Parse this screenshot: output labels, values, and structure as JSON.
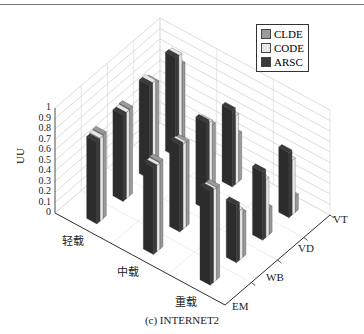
{
  "caption": "(c)  INTERNET2",
  "legend": [
    {
      "label": "CLDE",
      "color": "#9a9a9a"
    },
    {
      "label": "CODE",
      "color": "#e8e8e8"
    },
    {
      "label": "ARSC",
      "color": "#3a3a3a"
    }
  ],
  "yaxis": {
    "label": "UU",
    "ticks": [
      "0",
      "0.1",
      "0.2",
      "0.3",
      "0.4",
      "0.5",
      "0.6",
      "0.7",
      "0.8",
      "0.9",
      "1"
    ]
  },
  "load_labels": [
    "轻载",
    "中载",
    "重载"
  ],
  "method_labels": [
    "EM",
    "WB",
    "VD",
    "VT"
  ],
  "chart_data": {
    "type": "bar3d",
    "title": "(c) INTERNET2",
    "xlabel": "",
    "ylabel": "UU",
    "zlim": [
      0,
      1
    ],
    "load_categories": [
      "轻载",
      "中载",
      "重载"
    ],
    "method_categories": [
      "EM",
      "WB",
      "VD",
      "VT"
    ],
    "series": [
      {
        "name": "CLDE",
        "values": [
          [
            0.8,
            0.83,
            0.86,
            0.82
          ],
          [
            0.83,
            0.8,
            0.75,
            0.45
          ],
          [
            0.88,
            0.42,
            0.25,
            0.15
          ]
        ]
      },
      {
        "name": "CODE",
        "values": [
          [
            0.79,
            0.82,
            0.89,
            0.93
          ],
          [
            0.82,
            0.81,
            0.8,
            0.65
          ],
          [
            0.88,
            0.47,
            0.55,
            0.52
          ]
        ]
      },
      {
        "name": "ARSC",
        "values": [
          [
            0.78,
            0.82,
            0.89,
            0.94
          ],
          [
            0.83,
            0.83,
            0.83,
            0.73
          ],
          [
            0.9,
            0.55,
            0.65,
            0.62
          ]
        ]
      }
    ],
    "legend_position": "upper right",
    "grid": true
  }
}
